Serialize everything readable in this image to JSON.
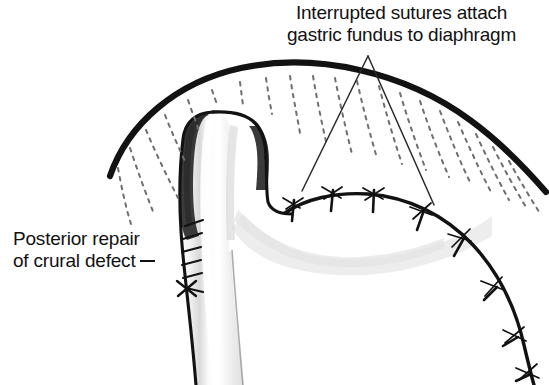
{
  "figure": {
    "background_color": "#ffffff",
    "ink_color": "#121212",
    "width": 549,
    "height": 385
  },
  "annotations": {
    "sutures_label": {
      "line1": "Interrupted sutures attach",
      "line2": "gastric fundus to diaphragm"
    },
    "crural_label": {
      "line1": "Posterior repair",
      "line2": "of crural defect"
    }
  },
  "anatomy": {
    "diaphragm_name": "diaphragm-arc",
    "esophagus_name": "esophagus",
    "fundus_name": "gastric-fundus",
    "crural_sutures_count": 7,
    "fundus_sutures_count": 8,
    "muscle_fiber_count": 20
  },
  "colors": {
    "ink": "#121212",
    "dark_shade": "#3b3b3b",
    "mid_shade": "#9a9a9a",
    "light_shade": "#e3e3e3",
    "pale_shade": "#f0f0f0",
    "leader_line": "#2a2a2a"
  }
}
